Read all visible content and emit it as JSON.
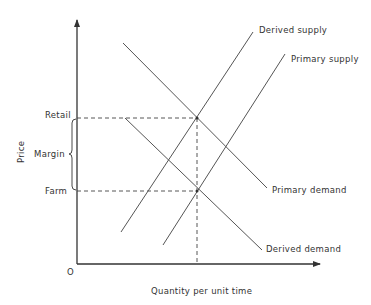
{
  "diagram": {
    "type": "supply-demand",
    "axes": {
      "y_label": "Price",
      "x_label": "Quantity per unit time",
      "origin_label": "O"
    },
    "price_levels": {
      "retail_label": "Retail",
      "farm_label": "Farm",
      "margin_label": "Margin"
    },
    "curves": [
      {
        "id": "derived-supply",
        "label": "Derived supply"
      },
      {
        "id": "primary-supply",
        "label": "Primary supply"
      },
      {
        "id": "primary-demand",
        "label": "Primary demand"
      },
      {
        "id": "derived-demand",
        "label": "Derived demand"
      }
    ],
    "colors": {
      "line": "#555555",
      "axis": "#333333",
      "text": "#333333",
      "background": "#ffffff"
    }
  }
}
